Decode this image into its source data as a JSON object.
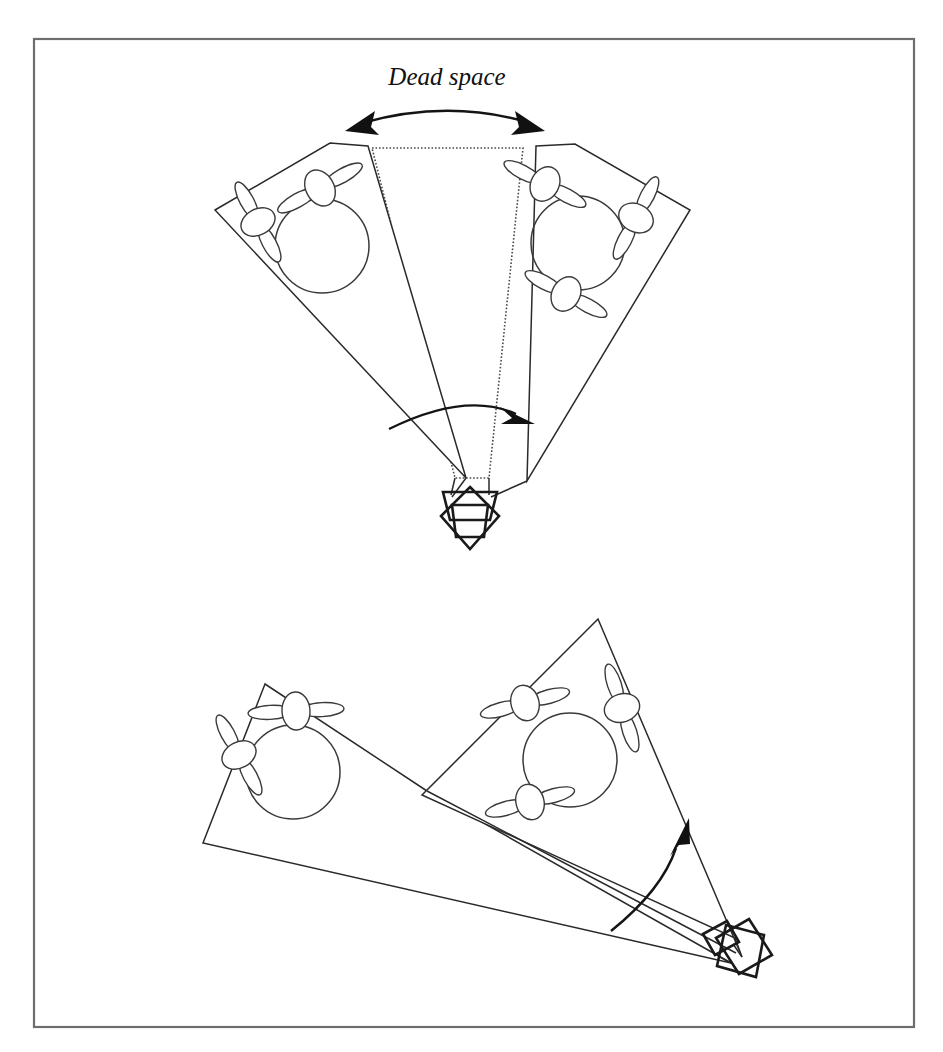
{
  "figure": {
    "background_color": "#ffffff",
    "frame": {
      "name": "figure-border",
      "x": 34,
      "y": 39,
      "width": 880,
      "height": 988,
      "stroke_color": "#6d6d70",
      "stroke_width": 2.2
    },
    "labels": {
      "dead_space": "Dead space"
    },
    "stroke_colors": {
      "outline": "#2a2a2a",
      "dotted": "#4a4a4a",
      "vehicle": "#1a1a1a",
      "arrow": "#111111",
      "frame": "#6d6d70"
    },
    "panels": [
      {
        "id": "top-panel",
        "name": "top-configuration",
        "description": "Two angularly separated sensor footprints leaving a dotted dead space wedge between them",
        "apex": {
          "x": 470,
          "y": 515
        },
        "has_dead_space": true,
        "sectors": [
          {
            "id": "top-left-sector",
            "name": "left-sensor-footprint",
            "polygon": "215,210 330,143 368,145 482,480",
            "circle": {
              "cx": 322,
              "cy": 246,
              "r": 47
            },
            "rotor_count": 2,
            "rotors": [
              {
                "cx": 320,
                "cy": 188,
                "rot": -29
              },
              {
                "cx": 258,
                "cy": 222,
                "rot": 62
              }
            ]
          },
          {
            "id": "top-right-sector",
            "name": "right-sensor-footprint",
            "polygon": "536,146 575,144 690,210 521,481",
            "circle": {
              "cx": 578,
              "cy": 243,
              "r": 47
            },
            "rotor_count": 3,
            "rotors": [
              {
                "cx": 545,
                "cy": 184,
                "rot": 28
              },
              {
                "cx": 634,
                "cy": 218,
                "rot": 117
              },
              {
                "cx": 566,
                "cy": 294,
                "rot": 28
              }
            ]
          }
        ],
        "dead_space": {
          "id": "top-dead-space",
          "name": "dead-space-region",
          "polygon": "372,148 523,148 489,478 455,478",
          "style": "dotted"
        },
        "sweep_arc": {
          "name": "field-of-view-sweep-arc",
          "path": "M 392,427 Q 470,394 528,417",
          "arrow_at": "end"
        },
        "dead_space_arrow": {
          "name": "dead-space-span-arrow",
          "path": "M 352,124 Q 447,100 536,123",
          "arrow_at": "both"
        },
        "caption": {
          "text_key": "dead_space",
          "x": 447,
          "y": 85
        },
        "vehicle": {
          "name": "sensor-vehicle-body",
          "cx": 470,
          "cy": 516,
          "plates": [
            "444,493 496,493 489,540 451,540",
            "470,484 500,515 470,548 440,515"
          ]
        }
      },
      {
        "id": "bottom-panel",
        "name": "bottom-configuration",
        "description": "Two adjacent sensor footprints with no dead space between them",
        "apex": {
          "x": 740,
          "y": 945
        },
        "has_dead_space": false,
        "sectors": [
          {
            "id": "bottom-left-sector",
            "name": "left-sensor-footprint",
            "polygon": "265,684 203,843 721,962 427,790",
            "circle": {
              "cx": 293,
              "cy": 772,
              "r": 47
            },
            "rotor_count": 2,
            "rotors": [
              {
                "cx": 296,
                "cy": 711,
                "rot": -3
              },
              {
                "cx": 239,
                "cy": 755,
                "rot": 62
              }
            ]
          },
          {
            "id": "bottom-right-sector",
            "name": "right-sensor-footprint",
            "polygon": "598,619 422,794 737,938 728,960",
            "circle": {
              "cx": 570,
              "cy": 760,
              "r": 47
            },
            "rotor_count": 3,
            "rotors": [
              {
                "cx": 525,
                "cy": 703,
                "rot": -15
              },
              {
                "cx": 620,
                "cy": 708,
                "rot": 72
              },
              {
                "cx": 530,
                "cy": 802,
                "rot": -15
              }
            ]
          }
        ],
        "sweep_arc": {
          "name": "field-of-view-sweep-arc",
          "path": "M 618,925 Q 666,885 679,842",
          "arrow_at": "end"
        },
        "vehicle": {
          "name": "sensor-vehicle-body",
          "cx": 744,
          "cy": 955,
          "plates": [
            "718,938 752,921 776,957 741,975",
            "728,925 764,937 755,977 718,964"
          ]
        }
      }
    ]
  }
}
